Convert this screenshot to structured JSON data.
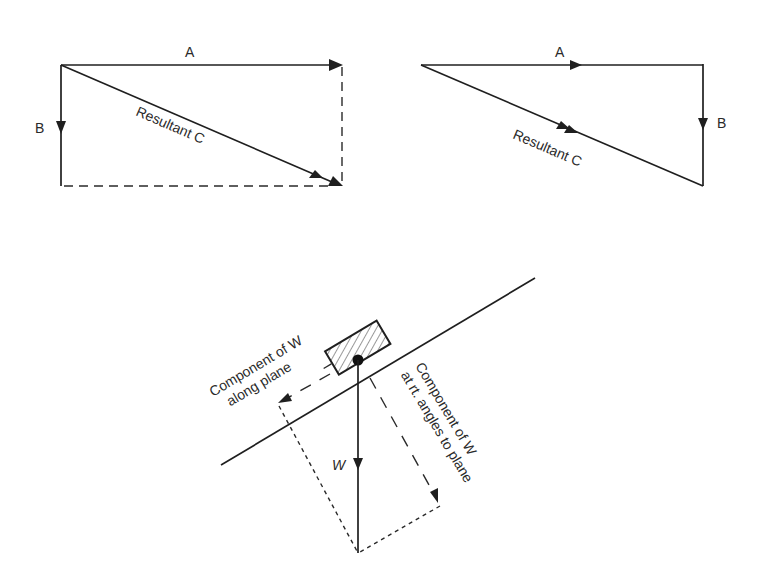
{
  "figure": {
    "panel_parallelogram": {
      "vector_a_label": "A",
      "vector_b_label": "B",
      "resultant_label": "Resultant C"
    },
    "panel_triangle": {
      "vector_a_label": "A",
      "vector_b_label": "B",
      "resultant_label": "Resultant C"
    },
    "panel_inclined_plane": {
      "weight_label": "W",
      "along_plane_line1": "Component of W",
      "along_plane_line2": "along plane",
      "perpendicular_line1": "Component of W",
      "perpendicular_line2": "at rt. angles to plane"
    }
  }
}
